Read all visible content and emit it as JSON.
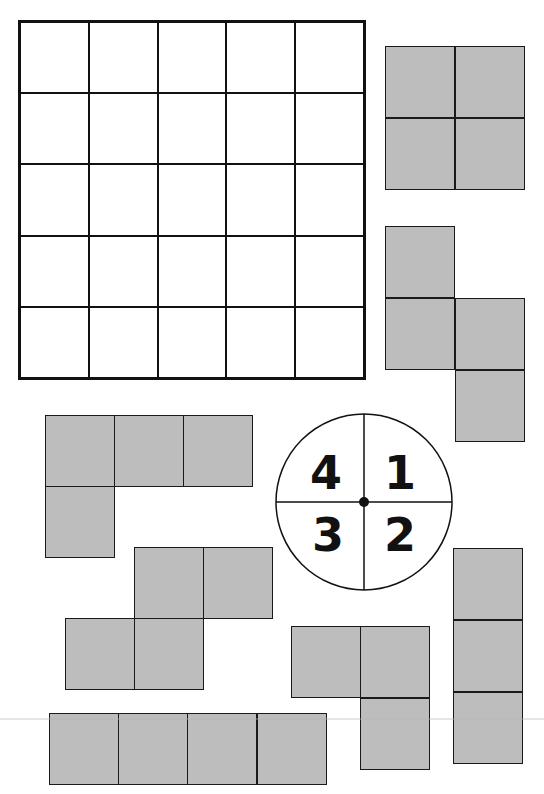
{
  "board": {
    "rows": 5,
    "cols": 5
  },
  "spinner": {
    "sections": [
      {
        "position": "top-left",
        "label": "4"
      },
      {
        "position": "top-right",
        "label": "1"
      },
      {
        "position": "bottom-left",
        "label": "3"
      },
      {
        "position": "bottom-right",
        "label": "2"
      }
    ]
  },
  "colors": {
    "piece_fill": "#bdbdbd",
    "outline": "#111111",
    "background": "#ffffff"
  },
  "pieces": [
    {
      "name": "square-tetromino",
      "cells": 4
    },
    {
      "name": "s-tetromino-vertical",
      "cells": 4
    },
    {
      "name": "l-tetromino",
      "cells": 4
    },
    {
      "name": "s-tetromino-horizontal",
      "cells": 4
    },
    {
      "name": "l-tromino",
      "cells": 3
    },
    {
      "name": "i-tromino-vertical",
      "cells": 3
    },
    {
      "name": "i-tetromino-horizontal",
      "cells": 4
    }
  ]
}
